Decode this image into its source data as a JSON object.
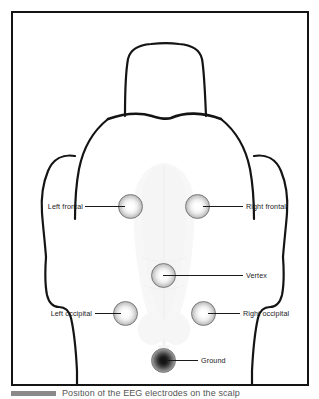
{
  "figure": {
    "caption": "Position of the EEG electrodes on the scalp",
    "subject_view": "dorsal view of canine head and neck outline",
    "frame_color": "#141414",
    "background_color": "#ffffff"
  },
  "electrodes": [
    {
      "id": "left-frontal",
      "label": "Left frontal",
      "type": "recording",
      "style": "light",
      "cx": 129,
      "cy": 204,
      "diameter": 25,
      "label_side": "left"
    },
    {
      "id": "right-frontal",
      "label": "Right frontal",
      "type": "recording",
      "style": "light",
      "cx": 196,
      "cy": 204,
      "diameter": 25,
      "label_side": "right"
    },
    {
      "id": "vertex",
      "label": "Vertex",
      "type": "recording",
      "style": "light",
      "cx": 162,
      "cy": 273,
      "diameter": 25,
      "label_side": "right"
    },
    {
      "id": "left-occipital",
      "label": "Left occipital",
      "type": "recording",
      "style": "light",
      "cx": 124,
      "cy": 311,
      "diameter": 25,
      "label_side": "left"
    },
    {
      "id": "right-occipital",
      "label": "Right occipital",
      "type": "recording",
      "style": "light",
      "cx": 202,
      "cy": 311,
      "diameter": 25,
      "label_side": "right"
    },
    {
      "id": "ground",
      "label": "Ground",
      "type": "ground",
      "style": "dark",
      "cx": 162,
      "cy": 358,
      "diameter": 25,
      "label_side": "right"
    }
  ],
  "colors": {
    "outline": "#141414",
    "leader_line": "#1a1a1a",
    "label_text": "#1a1a1a",
    "brain_ghost": "#f2f2f2",
    "caption_rule": "#8a8a8a",
    "caption_text": "#555555"
  }
}
